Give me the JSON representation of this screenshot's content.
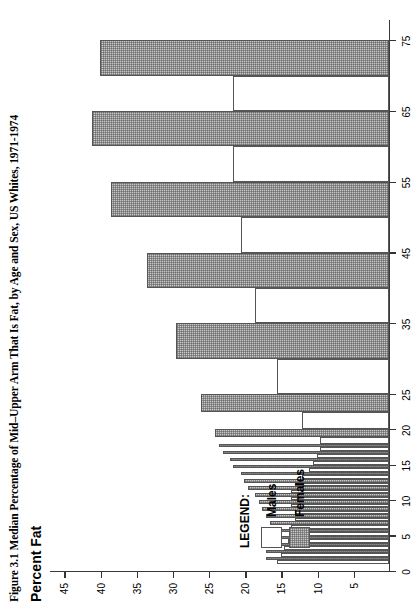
{
  "figure": {
    "caption": "Figure 3.1  Median Percentage of Mid–Upper Arm That Is Fat, by Age and Sex, US Whites, 1971-1974",
    "value_axis_title": "Percent Fat"
  },
  "legend": {
    "title": "LEGEND:",
    "entries": [
      {
        "label": "Males",
        "swatch": "white-square",
        "color": "#ffffff"
      },
      {
        "label": "Females",
        "swatch": "hatched-square",
        "color": "#c9c9c9"
      }
    ]
  },
  "chart_data": {
    "type": "bar",
    "orientation": "horizontal-rotated",
    "title": "Figure 3.1  Median Percentage of Mid–Upper Arm That Is Fat, by Age and Sex, US Whites, 1971-1974",
    "xlabel": "Age (years)",
    "ylabel": "Percent Fat",
    "xlim": [
      0,
      78
    ],
    "ylim": [
      0,
      47
    ],
    "x_ticks": [
      0,
      5,
      10,
      15,
      20,
      25,
      35,
      45,
      55,
      65,
      75
    ],
    "y_ticks": [
      5,
      10,
      15,
      20,
      25,
      30,
      35,
      40,
      45
    ],
    "grid": false,
    "legend_position": "left-inside",
    "age_bins": [
      {
        "label": "1",
        "start": 1,
        "end": 2
      },
      {
        "label": "2",
        "start": 2,
        "end": 3
      },
      {
        "label": "3",
        "start": 3,
        "end": 4
      },
      {
        "label": "4",
        "start": 4,
        "end": 5
      },
      {
        "label": "5",
        "start": 5,
        "end": 6
      },
      {
        "label": "6",
        "start": 6,
        "end": 7
      },
      {
        "label": "7",
        "start": 7,
        "end": 8
      },
      {
        "label": "8",
        "start": 8,
        "end": 9
      },
      {
        "label": "9",
        "start": 9,
        "end": 10
      },
      {
        "label": "10",
        "start": 10,
        "end": 11
      },
      {
        "label": "11",
        "start": 11,
        "end": 12
      },
      {
        "label": "12",
        "start": 12,
        "end": 13
      },
      {
        "label": "13",
        "start": 13,
        "end": 14
      },
      {
        "label": "14",
        "start": 14,
        "end": 15
      },
      {
        "label": "15",
        "start": 15,
        "end": 16
      },
      {
        "label": "16",
        "start": 16,
        "end": 17
      },
      {
        "label": "17",
        "start": 17,
        "end": 18
      },
      {
        "label": "18-19",
        "start": 18,
        "end": 20
      },
      {
        "label": "20-24",
        "start": 20,
        "end": 25
      },
      {
        "label": "25-34",
        "start": 25,
        "end": 35
      },
      {
        "label": "35-44",
        "start": 35,
        "end": 45
      },
      {
        "label": "45-54",
        "start": 45,
        "end": 55
      },
      {
        "label": "55-64",
        "start": 55,
        "end": 65
      },
      {
        "label": "65-74",
        "start": 65,
        "end": 75
      }
    ],
    "series": [
      {
        "name": "Males",
        "color": "#ffffff",
        "values": [
          15.5,
          15.0,
          14.5,
          14.0,
          13.5,
          13.5,
          13.0,
          13.0,
          13.5,
          13.5,
          13.5,
          13.0,
          12.0,
          11.0,
          10.5,
          10.0,
          9.5,
          9.5,
          12.0,
          15.5,
          18.5,
          20.5,
          21.5,
          21.5
        ]
      },
      {
        "name": "Females",
        "color": "#c9c9c9",
        "values": [
          17.0,
          17.0,
          17.0,
          16.5,
          16.5,
          16.5,
          17.0,
          17.5,
          18.0,
          18.5,
          19.5,
          20.0,
          20.5,
          21.5,
          22.0,
          23.0,
          23.5,
          24.0,
          26.0,
          29.5,
          33.5,
          38.5,
          41.0,
          40.0
        ]
      }
    ]
  }
}
